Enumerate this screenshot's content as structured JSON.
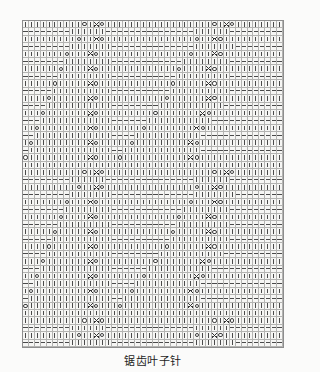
{
  "caption": "锯齿叶子针",
  "chart": {
    "columns": 44,
    "rows": 44,
    "grid_color": "#b4b4b2",
    "border_color": "#8d8d8d",
    "cell_bg": "#f6f6f4",
    "symbol_color": "#3a3a3a"
  },
  "legend": {
    "knit": "|",
    "purl": "−",
    "yarn_over": "o",
    "decrease_left": "/",
    "decrease_right": "\\",
    "double_decrease": "∧"
  },
  "chart_data": {
    "type": "heatmap",
    "title": "锯齿叶子针",
    "xlabel": "",
    "ylabel": "",
    "categories": [
      "knit",
      "purl",
      "yo",
      "dl",
      "dr",
      "dd",
      "none"
    ],
    "rows": [
      "kkkkkkkkkkokAokkkkkkkkkkkkkkkkkkokAokkkkkkkk",
      "ppppppppkkkkkkpppppppppppppppkkkkkkppppppppp",
      "kkkkkkkkkokkAokkkkkkkkkkkkkkkokkAokkkkkkkkkk",
      "ppppppppkkkkkkkppppppppppppppkkkkkkkpppppppp",
      "kkkkkkkokkkAokkkkkkkkkkkkkkkokkkAokkkkkkkkkk",
      "pppppppkkkkkkkkppppppppppppkkkkkkkkppppppppp",
      "kkkkkkokkkkAokkkkkkkkkkkkkokkkkAokkkkkkkkkkk",
      "ppppppkkkkkkkkkpppppppppppkkkkkkkkkpppppppppp",
      "kkkkkokkkkkAokkkkkkkkkkkkokkkkkAokkkkkkkkkkk",
      "pppppkkkkkkkkkkppppppppppkkkkkkkkkkpppppppppp",
      "kkkkokkkkkkAokkkkkkkkkkkokkkkkkAokkkkkkkkkkkk",
      "ppppkkkkkkkkkkkppppppppkkkkkkkkkkkpppppppppppp",
      "kkkokkkkkkkAokkkkkkkkkokkkkkkkAokkkkkkkkkkkkk",
      "pppkkkkkkkkkkkkppppppkkkkkkkkkkkppppppppppppp",
      "kkokkkkkkkkAokkkkkkkokkkkkkkkAokkkkkkkkkkkkkk",
      "ppkkkkkkkkkkkkkppppkkkkkkkkkkkpppppppppppppppp",
      "kokkkkkkkkkAokkkkkokkkkkkkkkAokkkkkkkkkkkkkkk",
      "pkkkkkkkkkkkkkkppkkkkkkkkkkkkkppppppppppppppp",
      "okkkkkkkkkkAokkkokkkkkkkkkkkAokkkkkkkkkkkkkkk",
      "kkkkkkkkkkkkkkkkkkkkkkkkkkkkkkkkkkkkkkkkkkkk",
      "kkkkkkkkkkokAokkkkkkkkkkkkkkkkkkokAokkkkkkkk",
      "ppppppppkkkkkkpppppppppppppppkkkkkkppppppppp",
      "kkkkkkkkkokkAokkkkkkkkkkkkkkkokkAokkkkkkkkkk",
      "ppppppppkkkkkkkppppppppppppppkkkkkkkpppppppp",
      "kkkkkkkokkkAokkkkkkkkkkkkkkkokkkAokkkkkkkkkk",
      "pppppppkkkkkkkkppppppppppppkkkkkkkkppppppppp",
      "kkkkkkokkkkAokkkkkkkkkkkkkokkkkAokkkkkkkkkkk",
      "ppppppkkkkkkkkkpppppppppppkkkkkkkkkpppppppppp",
      "kkkkkokkkkkAokkkkkkkkkkkkokkkkkAokkkkkkkkkkk",
      "pppppkkkkkkkkkkppppppppppkkkkkkkkkkpppppppppp",
      "kkkkokkkkkkAokkkkkkkkkkkokkkkkkAokkkkkkkkkkkk",
      "ppppkkkkkkkkkkkppppppppkkkkkkkkkkkpppppppppppp",
      "kkkokkkkkkkAokkkkkkkkkokkkkkkkAokkkkkkkkkkkkk",
      "pppkkkkkkkkkkkkppppppkkkkkkkkkkkppppppppppppp",
      "kkokkkkkkkkAokkkkkkkokkkkkkkkAokkkkkkkkkkkkkk",
      "ppkkkkkkkkkkkkkppppkkkkkkkkkkkpppppppppppppppp",
      "kokkkkkkkkkAokkkkkokkkkkkkkkAokkkkkkkkkkkkkkk",
      "pkkkkkkkkkkkkkkppkkkkkkkkkkkkkppppppppppppppp",
      "okkkkkkkkkkAokkkokkkkkkkkkkkAokkkkkkkkkkkkkkk",
      "kkkkkkkkkkkkkkkkkkkkkkkkkkkkkkkkkkkkkkkkkkkk",
      "kkkkkkkkkkokAokkkkkkkkkkkkkkkkkkokAokkkkkkkk",
      "ppppppppkkkkkkpppppppppppppppkkkkkkppppppppp",
      "kkkkkkkkkokkAokkkkkkkkkkkkkkkokkAokkkkkkkkkk",
      "ppppppppkkkkkkkppppppppppppppkkkkkkkpppppppp"
    ],
    "legend_position": "none",
    "grid": true
  }
}
